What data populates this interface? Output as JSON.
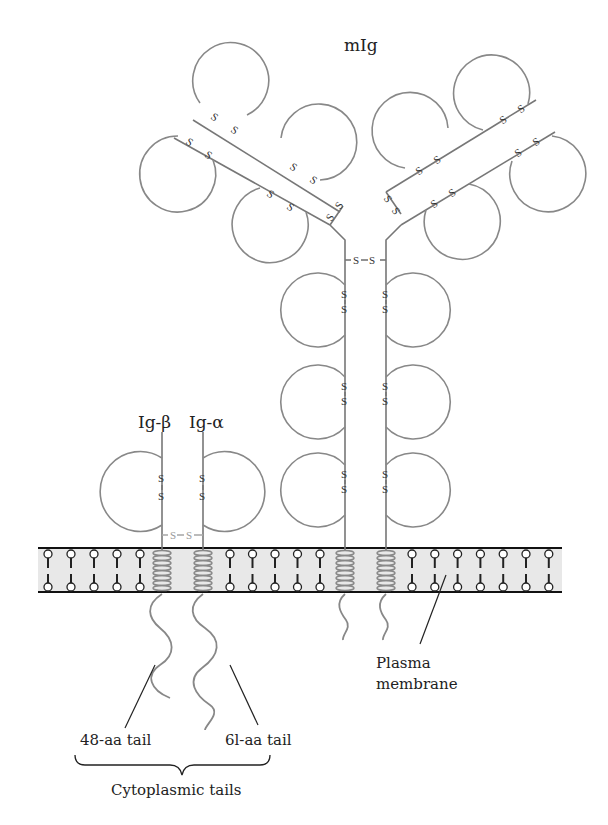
{
  "figure": {
    "type": "membrane immunoglobulin B-cell receptor schematic",
    "colors": {
      "membrane_fill": "#e8e8e8",
      "membrane_border": "#111111",
      "chain_stroke": "#777777",
      "helix_stroke": "#888888",
      "text": "#222222"
    }
  },
  "labels": {
    "mig": "mIg",
    "ig_beta": "Ig-β",
    "ig_alpha": "Ig-α",
    "plasma_membrane_line1": "Plasma",
    "plasma_membrane_line2": "membrane",
    "tail_48": "48-aa tail",
    "tail_61": "6l-aa tail",
    "cytoplasmic_tails": "Cytoplasmic tails"
  },
  "disulfide": {
    "s": "S",
    "ss_horizontal": "-S-S-"
  },
  "structure": {
    "mig_heavy_chain_domains_per_side": 3,
    "mig_fab_arms": 2,
    "fab_domains_per_arm": 4,
    "ig_beta_domains": 1,
    "ig_alpha_domains": 1,
    "transmembrane_helices": 4
  }
}
